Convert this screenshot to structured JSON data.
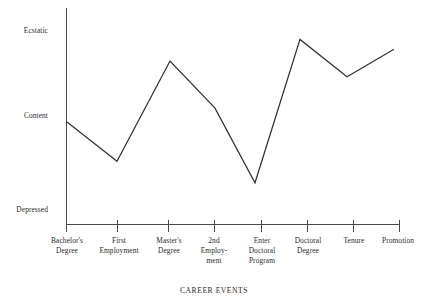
{
  "chart_data": {
    "type": "line",
    "title": "",
    "xlabel": "CAREER EVENTS",
    "ylabel": "",
    "grid": false,
    "legend": false,
    "categories": [
      "Bachelor's\nDegree",
      "First\nEmployment",
      "Master's\nDegree",
      "2nd\nEmploy-\nment",
      "Enter\nDoctoral\nProgram",
      "Doctoral\nDegree",
      "Tenure",
      "Promotion"
    ],
    "ytick_labels": [
      "Ecstatic",
      "Content",
      "Depressed"
    ],
    "ytick_values": [
      10,
      5,
      1
    ],
    "ylim": [
      0,
      11
    ],
    "values": [
      5.2,
      3.2,
      8.3,
      5.9,
      2.1,
      9.4,
      7.5,
      8.9
    ],
    "series": [
      {
        "name": "Career satisfaction",
        "values": [
          5.2,
          3.2,
          8.3,
          5.9,
          2.1,
          9.4,
          7.5,
          8.9
        ],
        "color": "#333333"
      }
    ],
    "annotations": []
  },
  "axis": {
    "x_title": "CAREER EVENTS",
    "y_ticks": [
      {
        "label": "Ecstatic"
      },
      {
        "label": "Content"
      },
      {
        "label": "Depressed"
      }
    ],
    "x_ticks": [
      {
        "label": "Bachelor's\nDegree"
      },
      {
        "label": "First\nEmployment"
      },
      {
        "label": "Master's\nDegree"
      },
      {
        "label": "2nd\nEmploy-\nment"
      },
      {
        "label": "Enter\nDoctoral\nProgram"
      },
      {
        "label": "Doctoral\nDegree"
      },
      {
        "label": "Tenure"
      },
      {
        "label": "Promotion"
      }
    ]
  },
  "style": {
    "background": "#ffffff",
    "axis_color": "#4a4a4a",
    "line_color": "#333333",
    "text_color": "#2b2b2b"
  }
}
